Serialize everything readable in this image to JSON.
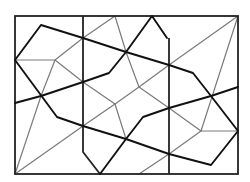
{
  "diagram": {
    "title": "",
    "colors": {
      "background": "#ffffff",
      "bold_line": "#111111",
      "thin_line": "#7a7a7a",
      "frame": "#222222"
    },
    "frame": {
      "x": 15,
      "y": 16,
      "width": 223,
      "height": 158
    },
    "dividers": [
      {
        "name": "left-divider",
        "points": "83,16 83,152 100,174"
      },
      {
        "name": "right-divider",
        "points": "169,38 169,174"
      }
    ],
    "bold_paths": [
      {
        "name": "bold-path-top",
        "points": "15,60 41,25 83,38 126,52 169,65 193,73 211,96 238,131 211,165 169,154 126,139 83,126 57,117 15,60"
      },
      {
        "name": "bold-path-middle-left",
        "points": "15,103 41,96 83,82 109,73 126,52 152,16 167,38"
      },
      {
        "name": "bold-path-middle-right",
        "points": "100,174 126,139 143,117 169,108 211,96 238,87"
      }
    ],
    "thin_paths": [
      {
        "name": "thin-path-1",
        "points": "15,60 55,60 83,82 115,104 139,87 126,52 115,16 83,38 55,60"
      },
      {
        "name": "thin-path-2",
        "points": "15,174 41,96 55,60"
      },
      {
        "name": "thin-path-3",
        "points": "15,174 83,126 115,104"
      },
      {
        "name": "thin-path-4",
        "points": "139,87 169,65 238,16 201,131 238,131"
      },
      {
        "name": "thin-path-5",
        "points": "139,87 169,108 201,131"
      },
      {
        "name": "thin-path-6",
        "points": "139,174 169,154 201,131"
      },
      {
        "name": "thin-path-7",
        "points": "115,104 126,139"
      }
    ]
  }
}
